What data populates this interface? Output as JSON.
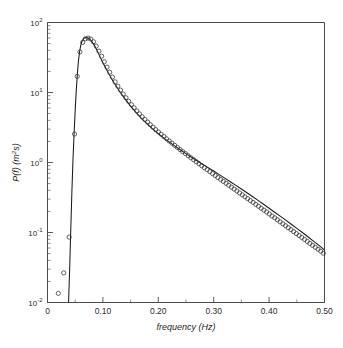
{
  "figure": {
    "name": "wave-energy-spectrum",
    "background_color": "#ffffff",
    "frame_color": "#4a4a4a"
  },
  "chart_data": {
    "type": "line",
    "title": "",
    "subtitle": "",
    "xlabel": "frequency (Hz)",
    "ylabel": "P(f) (m²s)",
    "ylabel_parts": {
      "p": "P(f) (m",
      "exp": "2",
      "tail": "s)"
    },
    "xscale": "linear",
    "yscale": "log",
    "xlim": [
      0.0,
      0.5
    ],
    "ylim": [
      0.01,
      100.0
    ],
    "grid": false,
    "legend": null,
    "xticks": [
      0.0,
      0.1,
      0.2,
      0.3,
      0.4,
      0.5
    ],
    "xticklabels": [
      "0",
      "0.10",
      "0.20",
      "0.30",
      "0.40",
      "0.50"
    ],
    "xminorticks": [
      0.05,
      0.15,
      0.25,
      0.35,
      0.45
    ],
    "yticks": [
      0.01,
      0.1,
      1.0,
      10.0,
      100.0
    ],
    "yticklabels": [
      "10-2",
      "10-1",
      "100",
      "101",
      "102"
    ],
    "ytick_mantissa": "10",
    "ytick_exponents": [
      "-2",
      "-1",
      "0",
      "1",
      "2"
    ],
    "marker_style": "open-circle",
    "marker_radius_px": 2.1,
    "line_style": "solid",
    "series": [
      {
        "name": "measured spectrum",
        "marker": "o",
        "x": [
          0.0195,
          0.0293,
          0.0391,
          0.0488,
          0.0537,
          0.0586,
          0.0635,
          0.0684,
          0.0732,
          0.0781,
          0.083,
          0.0879,
          0.0928,
          0.0977,
          0.1025,
          0.1074,
          0.1123,
          0.1172,
          0.1221,
          0.127,
          0.1318,
          0.1367,
          0.1416,
          0.1465,
          0.1514,
          0.1563,
          0.1611,
          0.166,
          0.1709,
          0.1758,
          0.1807,
          0.1855,
          0.1904,
          0.1953,
          0.2002,
          0.2051,
          0.21,
          0.2148,
          0.2197,
          0.2246,
          0.2295,
          0.2344,
          0.2393,
          0.2441,
          0.249,
          0.2539,
          0.2588,
          0.2637,
          0.2686,
          0.2734,
          0.2783,
          0.2832,
          0.2881,
          0.293,
          0.2979,
          0.3027,
          0.3076,
          0.3125,
          0.3174,
          0.3223,
          0.3271,
          0.332,
          0.3369,
          0.3418,
          0.3467,
          0.3516,
          0.3564,
          0.3613,
          0.3662,
          0.3711,
          0.376,
          0.3809,
          0.3857,
          0.3906,
          0.3955,
          0.4004,
          0.4053,
          0.4102,
          0.415,
          0.4199,
          0.4248,
          0.4297,
          0.4346,
          0.4395,
          0.4443,
          0.4492,
          0.4541,
          0.459,
          0.4639,
          0.4688,
          0.4736,
          0.4785,
          0.4834,
          0.4883,
          0.4932,
          0.498
        ],
        "y": [
          0.0135,
          0.0265,
          0.086,
          2.55,
          17.0,
          38.0,
          52.0,
          58.5,
          60.0,
          58.0,
          53.0,
          46.0,
          39.0,
          33.0,
          27.5,
          23.0,
          19.5,
          16.6,
          14.2,
          12.3,
          10.8,
          9.5,
          8.4,
          7.5,
          6.7,
          6.05,
          5.45,
          4.95,
          4.5,
          4.12,
          3.78,
          3.47,
          3.2,
          2.95,
          2.73,
          2.53,
          2.35,
          2.18,
          2.03,
          1.89,
          1.76,
          1.64,
          1.53,
          1.43,
          1.34,
          1.25,
          1.17,
          1.095,
          1.025,
          0.96,
          0.9,
          0.843,
          0.79,
          0.74,
          0.694,
          0.651,
          0.61,
          0.572,
          0.537,
          0.504,
          0.473,
          0.444,
          0.417,
          0.392,
          0.368,
          0.345,
          0.324,
          0.305,
          0.286,
          0.269,
          0.252,
          0.237,
          0.222,
          0.209,
          0.196,
          0.184,
          0.172,
          0.162,
          0.152,
          0.142,
          0.133,
          0.125,
          0.117,
          0.11,
          0.103,
          0.0965,
          0.0905,
          0.0848,
          0.0795,
          0.0745,
          0.0699,
          0.0655,
          0.0614,
          0.0576,
          0.054,
          0.0506
        ]
      },
      {
        "name": "fitted spectrum",
        "marker": null,
        "x": [
          0.038,
          0.04,
          0.042,
          0.044,
          0.046,
          0.048,
          0.05,
          0.052,
          0.054,
          0.056,
          0.058,
          0.06,
          0.062,
          0.064,
          0.066,
          0.068,
          0.07,
          0.072,
          0.074,
          0.076,
          0.078,
          0.08,
          0.083,
          0.086,
          0.09,
          0.095,
          0.1,
          0.11,
          0.12,
          0.13,
          0.14,
          0.15,
          0.16,
          0.17,
          0.18,
          0.19,
          0.2,
          0.21,
          0.22,
          0.23,
          0.24,
          0.25,
          0.26,
          0.27,
          0.28,
          0.29,
          0.3,
          0.31,
          0.32,
          0.33,
          0.34,
          0.35,
          0.36,
          0.37,
          0.38,
          0.39,
          0.4,
          0.41,
          0.42,
          0.43,
          0.44,
          0.45,
          0.46,
          0.47,
          0.48,
          0.49,
          0.5
        ],
        "y": [
          0.01,
          0.03,
          0.11,
          0.38,
          1.1,
          2.6,
          5.6,
          11.0,
          19.0,
          29.0,
          38.5,
          47.0,
          53.0,
          57.0,
          59.5,
          60.5,
          60.8,
          60.5,
          59.5,
          58.0,
          56.0,
          53.5,
          49.5,
          45.0,
          39.0,
          32.0,
          26.5,
          18.8,
          13.8,
          10.4,
          8.1,
          6.4,
          5.15,
          4.25,
          3.55,
          3.0,
          2.58,
          2.23,
          1.95,
          1.71,
          1.51,
          1.34,
          1.19,
          1.06,
          0.945,
          0.845,
          0.755,
          0.672,
          0.598,
          0.532,
          0.472,
          0.418,
          0.37,
          0.327,
          0.288,
          0.253,
          0.222,
          0.195,
          0.171,
          0.15,
          0.131,
          0.1145,
          0.1,
          0.087,
          0.0755,
          0.0655,
          0.0565
        ]
      }
    ]
  }
}
